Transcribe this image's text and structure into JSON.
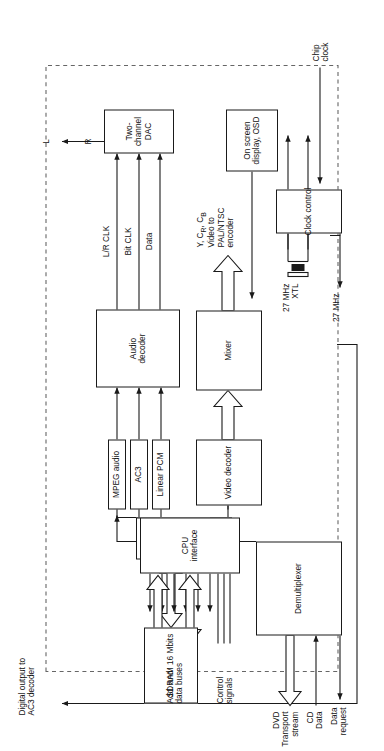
{
  "figure": {
    "chip_boundary_label": "",
    "caption": ""
  },
  "colors": {
    "line": "#1a1a1a",
    "text": "#111111",
    "background": "#ffffff",
    "dashed_boundary": "#666666"
  },
  "blocks": {
    "two_channel_dac": "Two-\nchannel\nDAC",
    "audio_decoder": "Audio\ndecoder",
    "mpeg_audio": "MPEG audio",
    "ac3": "AC3",
    "linear_pcm": "Linear PCM",
    "video_decoder": "Video decoder",
    "mixer": "Mixer",
    "osd": "On screen\ndisplay, OSD",
    "sdram": "SDRAM 16 Mbits",
    "memory_interface": "Memory\ninterface",
    "cpu_interface": "CPU\ninterface",
    "demultiplexer": "Demultiplexer",
    "clock_control": "Clock control"
  },
  "signals": {
    "left_out": "L",
    "right_out": "R",
    "digital_out_ac3": "Digital output to\nAC3 decoder",
    "video_out": "Y, CR, CB\nVideo to\nPAL/NTSC\nencoder",
    "lr_clk": "L/R CLK",
    "bit_clk": "Bit CLK",
    "data": "Data",
    "pess": "PESs",
    "add_data_buses": "Add. and\ndata buses",
    "control_signals": "Control\nsignals",
    "chip_clock": "Chip\nclock",
    "dvd_transport_stream": "DVD\nTransport\nstream",
    "cd_data": "CD\nData",
    "data_request": "Data\nrequest",
    "xtl_27mhz": "27 MHz\nXTL",
    "out_27mhz": "27 MHz"
  },
  "video_out_parts": {
    "y": "Y,",
    "cr_base": "C",
    "cr_sub": "R",
    "cb_base": "C",
    "cb_sub": "B",
    "rest": "Video to\nPAL/NTSC\nencoder"
  }
}
